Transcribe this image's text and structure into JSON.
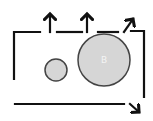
{
  "diagram": {
    "colors": {
      "stroke": "#111111",
      "circle_fill": "#d6d6d6",
      "circle_stroke": "#444444",
      "background": "#ffffff"
    },
    "circles": [
      {
        "id": "small",
        "cx": 56,
        "cy": 70,
        "r": 11,
        "label": ""
      },
      {
        "id": "large",
        "cx": 104,
        "cy": 60,
        "r": 26,
        "label": "B"
      }
    ],
    "arrows": [
      {
        "id": "up-arrow-1",
        "direction": "up"
      },
      {
        "id": "up-arrow-2",
        "direction": "up"
      },
      {
        "id": "up-right-arrow",
        "direction": "up-right"
      },
      {
        "id": "down-right-arrow",
        "direction": "down-right"
      }
    ]
  }
}
